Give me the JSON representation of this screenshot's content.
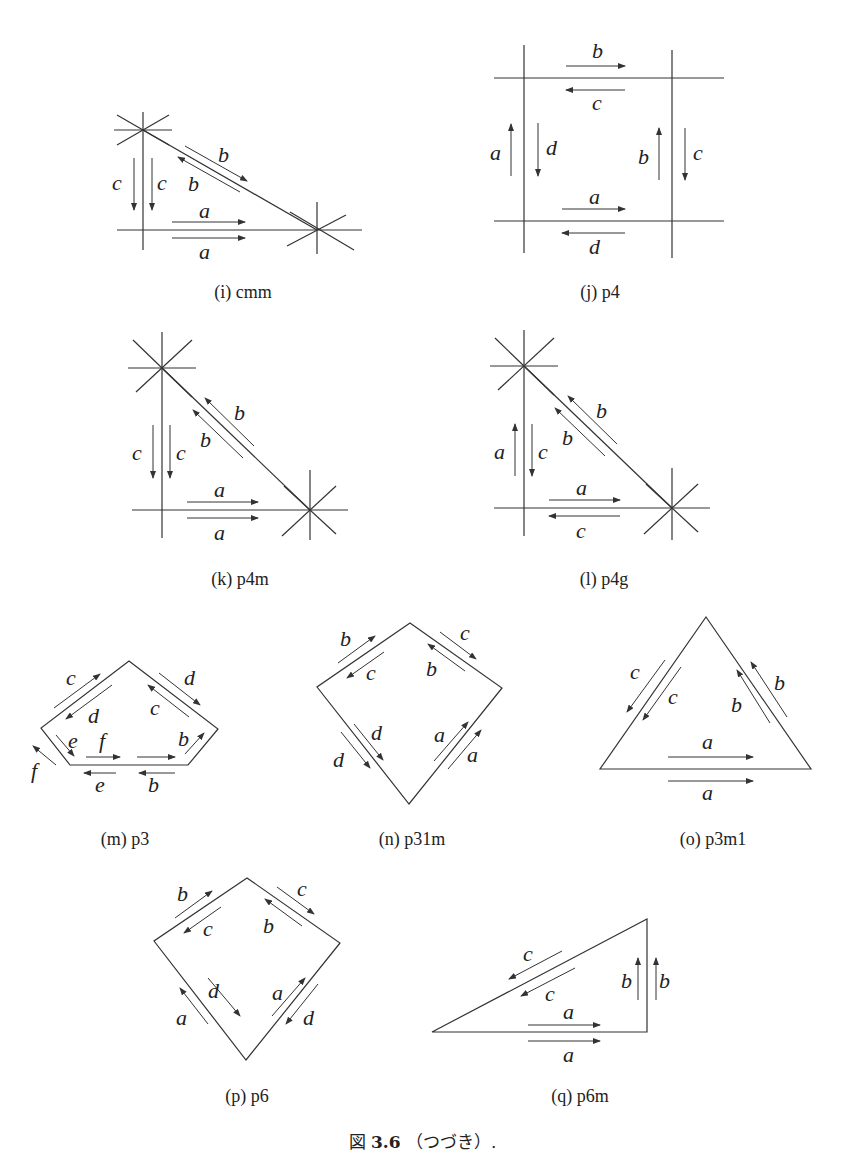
{
  "figure": {
    "caption_prefix": "図",
    "caption_number": "3.6",
    "caption_text": "（つづき）."
  },
  "panels": [
    {
      "id": "i",
      "caption": "(i) cmm",
      "edge_labels": [
        "a",
        "a",
        "b",
        "b",
        "c",
        "c"
      ]
    },
    {
      "id": "j",
      "caption": "(j) p4",
      "edge_labels": [
        "b",
        "c",
        "a",
        "d",
        "b",
        "c",
        "a",
        "d"
      ]
    },
    {
      "id": "k",
      "caption": "(k) p4m",
      "edge_labels": [
        "b",
        "b",
        "c",
        "c",
        "a",
        "a"
      ]
    },
    {
      "id": "l",
      "caption": "(l) p4g",
      "edge_labels": [
        "b",
        "b",
        "a",
        "c",
        "a",
        "c"
      ]
    },
    {
      "id": "m",
      "caption": "(m) p3",
      "edge_labels": [
        "c",
        "d",
        "d",
        "c",
        "e",
        "f",
        "b",
        "f",
        "e",
        "b"
      ]
    },
    {
      "id": "n",
      "caption": "(n) p31m",
      "edge_labels": [
        "b",
        "c",
        "c",
        "b",
        "d",
        "d",
        "a",
        "a"
      ]
    },
    {
      "id": "o",
      "caption": "(o) p3m1",
      "edge_labels": [
        "c",
        "c",
        "b",
        "b",
        "a",
        "a"
      ]
    },
    {
      "id": "p",
      "caption": "(p) p6",
      "edge_labels": [
        "b",
        "c",
        "c",
        "b",
        "d",
        "a",
        "a",
        "d"
      ]
    },
    {
      "id": "q",
      "caption": "(q) p6m",
      "edge_labels": [
        "c",
        "c",
        "b",
        "b",
        "a",
        "a"
      ]
    }
  ]
}
